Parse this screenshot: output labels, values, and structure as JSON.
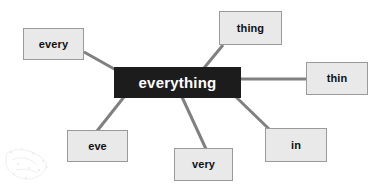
{
  "diagram": {
    "type": "word-web",
    "background_color": "#ffffff",
    "center": {
      "id": "center-everything",
      "label": "everything",
      "shape": "rectangle",
      "fill_color": "#1c1c1c",
      "text_color": "#ffffff",
      "border_color": "#1c1c1c",
      "x": 114,
      "y": 67,
      "width": 127,
      "height": 31
    },
    "leaves": [
      {
        "id": "node-every",
        "label": "every",
        "shape": "rectangle",
        "fill_color": "#e9e9e9",
        "text_color": "#111111",
        "border_color": "#9a9a9a",
        "x": 23,
        "y": 28,
        "width": 61,
        "height": 32
      },
      {
        "id": "node-thing",
        "label": "thing",
        "shape": "rectangle",
        "fill_color": "#e9e9e9",
        "text_color": "#111111",
        "border_color": "#9a9a9a",
        "x": 219,
        "y": 11,
        "width": 63,
        "height": 34
      },
      {
        "id": "node-thin",
        "label": "thin",
        "shape": "rectangle",
        "fill_color": "#e9e9e9",
        "text_color": "#111111",
        "border_color": "#9a9a9a",
        "x": 306,
        "y": 62,
        "width": 62,
        "height": 33
      },
      {
        "id": "node-in",
        "label": "in",
        "shape": "rectangle",
        "fill_color": "#e9e9e9",
        "text_color": "#111111",
        "border_color": "#9a9a9a",
        "x": 265,
        "y": 128,
        "width": 62,
        "height": 34
      },
      {
        "id": "node-very",
        "label": "very",
        "shape": "rectangle",
        "fill_color": "#e9e9e9",
        "text_color": "#111111",
        "border_color": "#9a9a9a",
        "x": 174,
        "y": 148,
        "width": 59,
        "height": 33
      },
      {
        "id": "node-eve",
        "label": "eve",
        "shape": "rectangle",
        "fill_color": "#e9e9e9",
        "text_color": "#111111",
        "border_color": "#9a9a9a",
        "x": 67,
        "y": 130,
        "width": 61,
        "height": 32
      }
    ],
    "connectors": [
      {
        "id": "connector-every",
        "from": "center-everything",
        "to": "node-every",
        "x1": 116,
        "y1": 70,
        "x2": 84,
        "y2": 52,
        "color": "#808080",
        "width": 3
      },
      {
        "id": "connector-thing",
        "from": "center-everything",
        "to": "node-thing",
        "x1": 204,
        "y1": 68,
        "x2": 223,
        "y2": 45,
        "color": "#808080",
        "width": 3
      },
      {
        "id": "connector-thin",
        "from": "center-everything",
        "to": "node-thin",
        "x1": 241,
        "y1": 79,
        "x2": 306,
        "y2": 79,
        "color": "#808080",
        "width": 3
      },
      {
        "id": "connector-in",
        "from": "center-everything",
        "to": "node-in",
        "x1": 236,
        "y1": 97,
        "x2": 269,
        "y2": 129,
        "color": "#808080",
        "width": 3
      },
      {
        "id": "connector-very",
        "from": "center-everything",
        "to": "node-very",
        "x1": 182,
        "y1": 97,
        "x2": 206,
        "y2": 149,
        "color": "#808080",
        "width": 3
      },
      {
        "id": "connector-eve",
        "from": "center-everything",
        "to": "node-eve",
        "x1": 124,
        "y1": 97,
        "x2": 97,
        "y2": 131,
        "color": "#808080",
        "width": 3
      }
    ]
  }
}
